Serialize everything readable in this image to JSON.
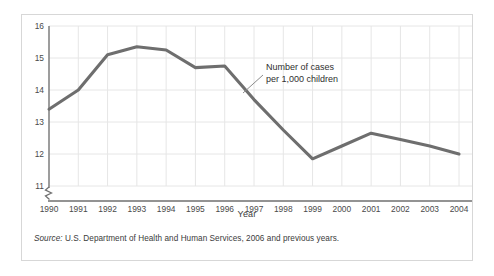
{
  "figure": {
    "axis_title_x": "Year",
    "source_label": "Source:",
    "source_text": " U.S. Department of Health and Human Services, 2006 and previous years.",
    "annotation_line1": "Number of cases",
    "annotation_line2": "per 1,000 children",
    "colors": {
      "line": "#6e6e6e",
      "grid": "#e6e6e6",
      "axis": "#6f6f6f",
      "border": "#d7d7d7",
      "text": "#3b3b3b",
      "background": "#ffffff"
    }
  },
  "chart_data": {
    "type": "line",
    "title": "",
    "xlabel": "Year",
    "ylabel": "",
    "annotation": "Number of cases per 1,000 children",
    "categories": [
      "1990",
      "1991",
      "1992",
      "1993",
      "1994",
      "1995",
      "1996",
      "1997",
      "1998",
      "1999",
      "2000",
      "2001",
      "2002",
      "2003",
      "2004"
    ],
    "values": [
      13.4,
      14.0,
      15.1,
      15.35,
      15.25,
      14.7,
      14.75,
      13.7,
      12.75,
      11.85,
      12.25,
      12.65,
      12.45,
      12.25,
      12.0
    ],
    "x": [
      1990,
      1991,
      1992,
      1993,
      1994,
      1995,
      1996,
      1997,
      1998,
      1999,
      2000,
      2001,
      2002,
      2003,
      2004
    ],
    "ylim": [
      11,
      16
    ],
    "yticks": [
      11,
      12,
      13,
      14,
      15,
      16
    ],
    "ytick_labels": [
      "11",
      "12",
      "13",
      "14",
      "15",
      "16"
    ],
    "xlim": [
      1990,
      2004
    ],
    "grid": true,
    "axis_break": true,
    "legend": "none"
  }
}
